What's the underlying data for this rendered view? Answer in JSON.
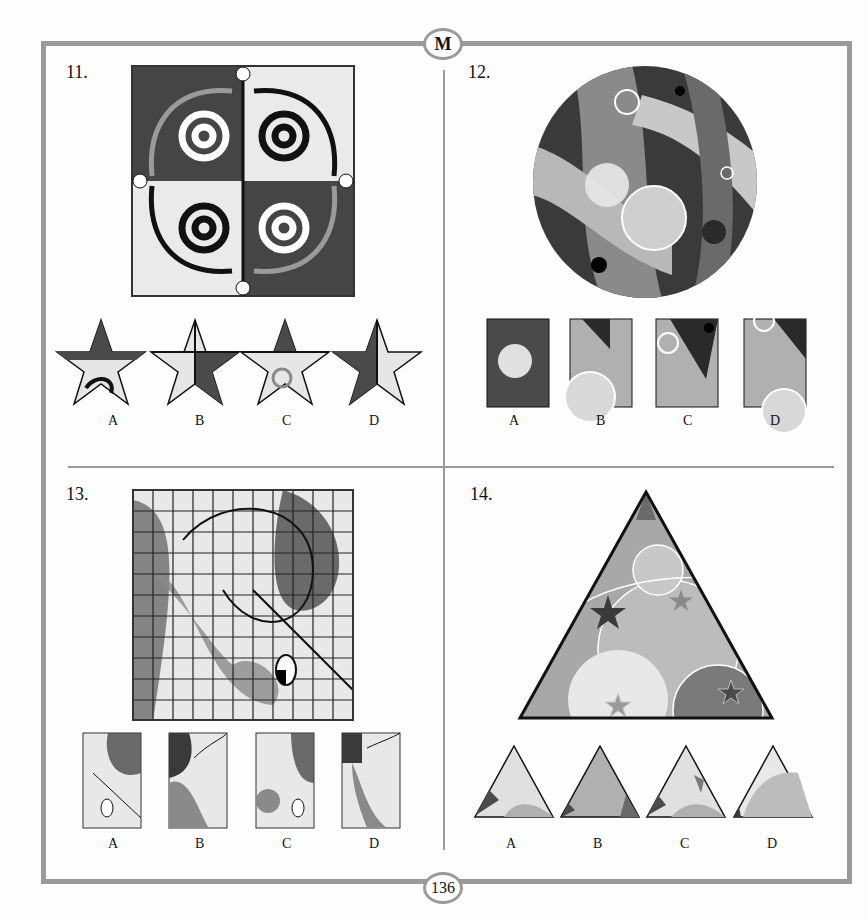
{
  "page": {
    "section_badge": "M",
    "page_number": "136"
  },
  "questions": [
    {
      "number": "11.",
      "figure": "square-quadrant-swirl-pattern",
      "option_shape": "star",
      "options": [
        "A",
        "B",
        "C",
        "D"
      ]
    },
    {
      "number": "12.",
      "figure": "circle-abstract-bands-with-rings",
      "option_shape": "rectangle",
      "options": [
        "A",
        "B",
        "C",
        "D"
      ]
    },
    {
      "number": "13.",
      "figure": "checkered-grid-with-curves",
      "option_shape": "rectangle-grid",
      "options": [
        "A",
        "B",
        "C",
        "D"
      ]
    },
    {
      "number": "14.",
      "figure": "triangle-circles-and-stars",
      "option_shape": "small-triangle",
      "options": [
        "A",
        "B",
        "C",
        "D"
      ]
    }
  ],
  "colors": {
    "frame": "#9a9a9a",
    "dark": "#3a3a3a",
    "mid": "#8a8a8a",
    "light": "#e6e6e6"
  }
}
